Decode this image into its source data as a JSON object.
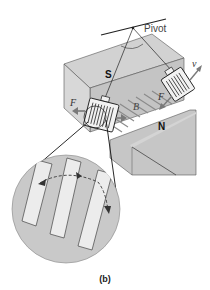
{
  "figure": {
    "caption": "(b)",
    "labels": {
      "pivot": "Pivot",
      "south_pole": "S",
      "north_pole": "N",
      "force_left": "F",
      "force_right": "F",
      "field": "B",
      "velocity": "v"
    },
    "components": [
      "pivot-bar",
      "magnet-south-pole-block",
      "magnet-north-pole-block",
      "slotted-plate-left-position",
      "slotted-plate-right-position",
      "magnified-inset-circle",
      "eddy-current-arrows"
    ],
    "colors": {
      "magnet_gray": "#c8c8c8",
      "magnet_face_light": "#d6d6d6",
      "magnet_face_dark": "#bdbdbd",
      "plate_fill": "#f0f0f0",
      "inset_fill": "#c9c9c9",
      "slot_fill": "#ececec",
      "line": "#222222",
      "arrow_gray": "#8a8a8a"
    }
  }
}
